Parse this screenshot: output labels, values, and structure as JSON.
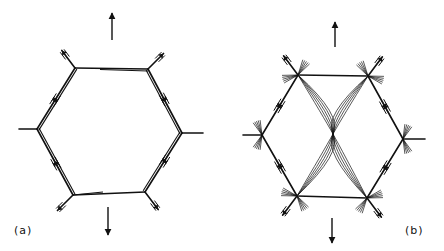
{
  "figure": {
    "panels": [
      {
        "id": "a",
        "label": "(a)",
        "label_pos": [
          14,
          232
        ],
        "vertices": {
          "top_left": [
            75,
            68
          ],
          "top_right": [
            148,
            69
          ],
          "right": [
            182,
            133
          ],
          "bottom_right": [
            145,
            192
          ],
          "bottom_left": [
            73,
            195
          ],
          "left": [
            37,
            129
          ]
        },
        "stubs": [
          {
            "from": [
              37,
              129
            ],
            "to": [
              19,
              129
            ]
          },
          {
            "from": [
              182,
              133
            ],
            "to": [
              203,
              133
            ]
          }
        ],
        "up_arrow": {
          "x": 112,
          "y1": 40,
          "y2": 13
        },
        "down_arrow": {
          "x": 108,
          "y1": 207,
          "y2": 235
        }
      },
      {
        "id": "b",
        "label": "(b)",
        "label_pos": [
          405,
          232
        ],
        "vertices": {
          "top_left": [
            298,
            75
          ],
          "top_right": [
            368,
            76
          ],
          "right": [
            403,
            139
          ],
          "bottom_right": [
            367,
            198
          ],
          "bottom_left": [
            297,
            196
          ],
          "left": [
            262,
            135
          ]
        },
        "stubs": [
          {
            "from": [
              262,
              135
            ],
            "to": [
              243,
              135
            ]
          },
          {
            "from": [
              403,
              139
            ],
            "to": [
              425,
              139
            ]
          }
        ],
        "waist": [
          333,
          134
        ],
        "up_arrow": {
          "x": 335,
          "y1": 47,
          "y2": 22
        },
        "down_arrow": {
          "x": 332,
          "y1": 218,
          "y2": 243
        }
      }
    ],
    "colors": {
      "ink": "#111111",
      "background": "#ffffff"
    }
  }
}
